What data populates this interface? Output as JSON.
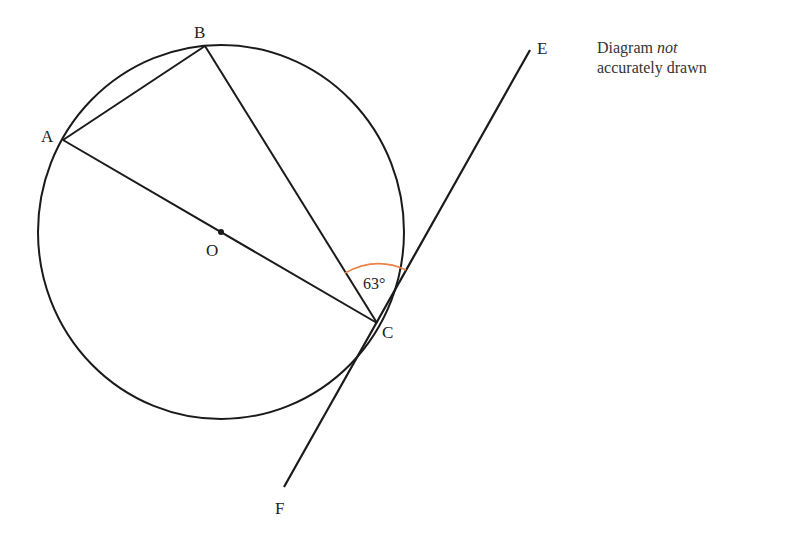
{
  "diagram": {
    "title_note": {
      "line1_prefix": "Diagram",
      "line1_italic": "not",
      "line2": "accurately drawn"
    },
    "points": {
      "A": {
        "label": "A",
        "x": 63,
        "y": 140
      },
      "B": {
        "label": "B",
        "x": 205,
        "y": 44
      },
      "C": {
        "label": "C",
        "x": 377,
        "y": 323
      },
      "O": {
        "label": "O",
        "x": 221,
        "y": 232
      },
      "E": {
        "label": "E",
        "x": 530,
        "y": 50
      },
      "F": {
        "label": "F",
        "x": 283,
        "y": 490
      }
    },
    "circle": {
      "cx": 221,
      "cy": 232,
      "rx": 183,
      "ry": 187,
      "stroke": "#1a1a1a"
    },
    "angle_label": "63°",
    "angle_arc_color": "#e8834a",
    "segments": [
      "AB",
      "BC",
      "AC (through O)",
      "EF (tangent at C)"
    ]
  }
}
